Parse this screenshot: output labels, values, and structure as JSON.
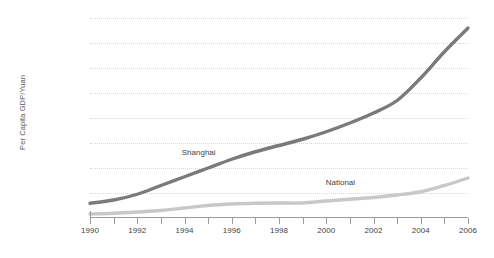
{
  "chart_data": {
    "type": "line",
    "title": "",
    "subtitle": "",
    "xlabel": "",
    "ylabel": "Per Capita GDP/Yuan",
    "xlim": [
      1990,
      2006
    ],
    "ylim": [
      0,
      80000
    ],
    "grid": true,
    "legend_position": "inline-annotations",
    "x": [
      1990,
      1991,
      1992,
      1993,
      1994,
      1995,
      1996,
      1997,
      1998,
      1999,
      2000,
      2001,
      2002,
      2003,
      2004,
      2005,
      2006
    ],
    "ytick_labels": [
      "0",
      "10,000",
      "20,000",
      "30,000",
      "40,000",
      "50,000",
      "60,000",
      "70,000",
      "80,000"
    ],
    "ytick_values": [
      0,
      10000,
      20000,
      30000,
      40000,
      50000,
      60000,
      70000,
      80000
    ],
    "xtick_labels": [
      "1990",
      "1992",
      "1994",
      "1996",
      "1998",
      "2000",
      "2002",
      "2004",
      "2006"
    ],
    "xtick_values": [
      1990,
      1992,
      1994,
      1996,
      1998,
      2000,
      2002,
      2004,
      2006
    ],
    "xtick_minor_values": [
      1991,
      1993,
      1995,
      1997,
      1999,
      2001,
      2003,
      2005
    ],
    "series": [
      {
        "name": "Shanghai",
        "color": "#7a7a7a",
        "stroke_width": 3.4,
        "label_x": 1994.6,
        "label_y": 26500,
        "values": [
          5900,
          7200,
          9500,
          13000,
          16500,
          20000,
          23500,
          26500,
          29000,
          31500,
          34500,
          38000,
          42000,
          47000,
          56000,
          66500,
          76000
        ]
      },
      {
        "name": "National",
        "color": "#c8c8c8",
        "stroke_width": 3.4,
        "label_x": 2000.6,
        "label_y": 14600,
        "values": [
          1600,
          1900,
          2400,
          3000,
          4000,
          5000,
          5600,
          5900,
          6000,
          6000,
          6800,
          7500,
          8200,
          9200,
          10500,
          13000,
          16000
        ]
      }
    ]
  }
}
